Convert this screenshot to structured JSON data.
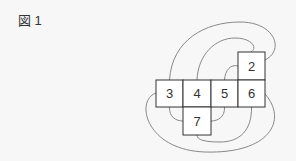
{
  "figure": {
    "label": "図 1"
  },
  "cells": [
    {
      "number": "2",
      "x": 238,
      "y": 52
    },
    {
      "number": "3",
      "x": 156,
      "y": 80
    },
    {
      "number": "4",
      "x": 183,
      "y": 80
    },
    {
      "number": "5",
      "x": 211,
      "y": 80
    },
    {
      "number": "6",
      "x": 238,
      "y": 80
    },
    {
      "number": "7",
      "x": 183,
      "y": 107
    }
  ],
  "colors": {
    "background": "#f7f7f7",
    "cell_border": "#333333",
    "curve": "#888888",
    "text": "#333333"
  }
}
